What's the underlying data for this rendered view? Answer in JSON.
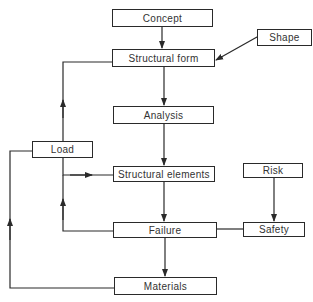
{
  "diagram": {
    "type": "flowchart",
    "nodes": {
      "concept": "Concept",
      "structural_form": "Structural form",
      "shape": "Shape",
      "analysis": "Analysis",
      "load": "Load",
      "structural_elements": "Structural elements",
      "risk": "Risk",
      "failure": "Failure",
      "safety": "Safety",
      "materials": "Materials"
    },
    "edges": [
      {
        "from": "Concept",
        "to": "Structural form"
      },
      {
        "from": "Shape",
        "to": "Structural form",
        "bidirectional": true
      },
      {
        "from": "Structural form",
        "to": "Analysis"
      },
      {
        "from": "Analysis",
        "to": "Structural elements"
      },
      {
        "from": "Load",
        "to": "Structural form"
      },
      {
        "from": "Load",
        "to": "Structural elements"
      },
      {
        "from": "Failure",
        "to": "Load"
      },
      {
        "from": "Materials",
        "to": "Load"
      },
      {
        "from": "Structural elements",
        "to": "Failure"
      },
      {
        "from": "Risk",
        "to": "Safety"
      },
      {
        "from": "Safety",
        "to": "Failure",
        "arrow": false
      },
      {
        "from": "Failure",
        "to": "Materials"
      }
    ],
    "colors": {
      "line": "#2a2a2a",
      "text": "#333333",
      "background": "#ffffff"
    }
  }
}
